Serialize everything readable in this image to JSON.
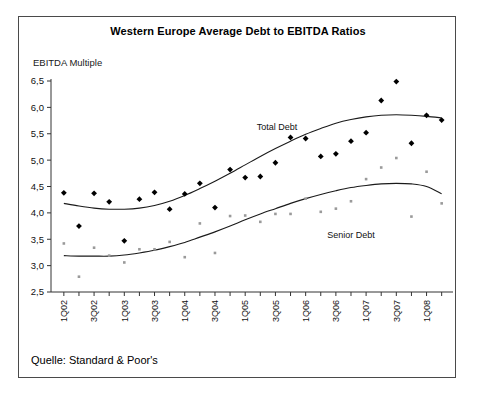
{
  "figure": {
    "source_note": "Quelle: Standard & Poor's",
    "border_color": "#4a4a4a",
    "background": "#ffffff"
  },
  "chart_data": {
    "type": "scatter",
    "title": "Western Europe Average Debt to EBITDA Ratios",
    "subtitle": "",
    "ylabel": "EBITDA Multiple",
    "xlabel": "",
    "ylim": [
      2.5,
      6.5
    ],
    "ytick_labels": [
      "2,5",
      "3,0",
      "3,5",
      "4,0",
      "4,5",
      "5,0",
      "5,5",
      "6,0",
      "6,5"
    ],
    "ytick_values": [
      2.5,
      3.0,
      3.5,
      4.0,
      4.5,
      5.0,
      5.5,
      6.0,
      6.5
    ],
    "grid": false,
    "legend_position": "inline-annotation",
    "x": [
      "1Q02",
      "2Q02",
      "3Q02",
      "4Q02",
      "1Q03",
      "2Q03",
      "3Q03",
      "4Q03",
      "1Q04",
      "2Q04",
      "3Q04",
      "4Q04",
      "1Q05",
      "2Q05",
      "3Q05",
      "4Q05",
      "1Q06",
      "2Q06",
      "3Q06",
      "4Q06",
      "1Q07",
      "2Q07",
      "3Q07",
      "4Q07",
      "1Q08",
      "2Q08"
    ],
    "xtick_labels": [
      "1Q02",
      "3Q02",
      "1Q03",
      "3Q03",
      "1Q04",
      "3Q04",
      "1Q05",
      "3Q05",
      "1Q06",
      "3Q06",
      "1Q07",
      "3Q07",
      "1Q08"
    ],
    "series": [
      {
        "name": "Total Debt",
        "marker": "diamond",
        "color": "#000000",
        "annotation": "Total Debt",
        "values": [
          4.38,
          3.75,
          4.37,
          4.21,
          3.47,
          4.26,
          4.39,
          4.07,
          4.36,
          4.56,
          4.1,
          4.82,
          4.67,
          4.69,
          4.95,
          5.43,
          5.41,
          5.07,
          5.12,
          5.36,
          5.52,
          6.13,
          6.49,
          5.32,
          5.85,
          5.76
        ],
        "trend": [
          4.18,
          4.13,
          4.09,
          4.07,
          4.07,
          4.09,
          4.14,
          4.22,
          4.33,
          4.46,
          4.6,
          4.75,
          4.91,
          5.07,
          5.22,
          5.36,
          5.49,
          5.6,
          5.7,
          5.77,
          5.82,
          5.85,
          5.86,
          5.85,
          5.83,
          5.8
        ]
      },
      {
        "name": "Senior Debt",
        "marker": "small-dot",
        "color": "#9a9a9a",
        "annotation": "Senior Debt",
        "values": [
          3.42,
          2.79,
          3.34,
          3.19,
          3.06,
          3.31,
          3.31,
          3.45,
          3.16,
          3.8,
          3.24,
          3.94,
          3.95,
          3.83,
          3.98,
          3.98,
          4.27,
          4.02,
          4.08,
          4.22,
          4.64,
          4.86,
          5.04,
          3.93,
          4.78,
          4.18
        ]
      }
    ],
    "senior_trend": [
      3.19,
      3.18,
      3.18,
      3.18,
      3.2,
      3.24,
      3.29,
      3.36,
      3.44,
      3.54,
      3.64,
      3.75,
      3.87,
      3.98,
      4.08,
      4.18,
      4.27,
      4.35,
      4.42,
      4.48,
      4.52,
      4.55,
      4.56,
      4.55,
      4.5,
      4.36
    ]
  }
}
